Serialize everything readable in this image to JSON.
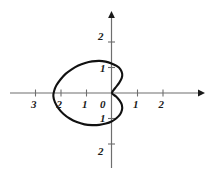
{
  "chart_data": {
    "type": "line",
    "title": "",
    "subtitle": "",
    "xlabel": "",
    "ylabel": "",
    "grid": false,
    "legend": false,
    "legend_position": "none",
    "coordinate_system": "cartesian-with-polar-curve",
    "xlim": [
      -3.6,
      3.5
    ],
    "ylim": [
      -2.6,
      2.6
    ],
    "x_ticks": [
      -3,
      -2,
      -1,
      0,
      1,
      2
    ],
    "x_tick_labels": [
      "3",
      "2",
      "1",
      "0",
      "1",
      "2"
    ],
    "y_ticks": [
      2,
      1,
      -1,
      -2
    ],
    "y_tick_labels": [
      "2",
      "1",
      "1",
      "2"
    ],
    "origin_label": "0",
    "axis_arrows": [
      "x-positive",
      "y-positive"
    ],
    "curve": {
      "name": "cardioid",
      "equation": "r = 1 - cos(theta)  (scaled, opening left)",
      "stroke": "#111111",
      "stroke_width": 2.1,
      "closed": true,
      "extent_left": -2.3,
      "extent_right": 0.42,
      "extent_top": 1.25,
      "extent_bottom": -1.25,
      "points": [
        [
          0.0,
          0.0
        ],
        [
          0.13,
          0.2
        ],
        [
          0.28,
          0.4
        ],
        [
          0.38,
          0.58
        ],
        [
          0.4,
          0.75
        ],
        [
          0.33,
          0.93
        ],
        [
          0.18,
          1.06
        ],
        [
          -0.02,
          1.16
        ],
        [
          -0.25,
          1.23
        ],
        [
          -0.5,
          1.26
        ],
        [
          -0.78,
          1.24
        ],
        [
          -1.05,
          1.18
        ],
        [
          -1.32,
          1.08
        ],
        [
          -1.58,
          0.93
        ],
        [
          -1.82,
          0.75
        ],
        [
          -2.02,
          0.53
        ],
        [
          -2.18,
          0.3
        ],
        [
          -2.27,
          0.08
        ],
        [
          -2.3,
          -0.12
        ],
        [
          -2.24,
          -0.36
        ],
        [
          -2.1,
          -0.6
        ],
        [
          -1.9,
          -0.82
        ],
        [
          -1.66,
          -1.0
        ],
        [
          -1.38,
          -1.14
        ],
        [
          -1.08,
          -1.23
        ],
        [
          -0.78,
          -1.26
        ],
        [
          -0.5,
          -1.25
        ],
        [
          -0.24,
          -1.2
        ],
        [
          -0.02,
          -1.12
        ],
        [
          0.16,
          -1.0
        ],
        [
          0.31,
          -0.85
        ],
        [
          0.39,
          -0.67
        ],
        [
          0.39,
          -0.48
        ],
        [
          0.3,
          -0.3
        ],
        [
          0.16,
          -0.14
        ],
        [
          0.0,
          0.0
        ]
      ]
    }
  },
  "axes_geometry": {
    "origin_px": [
      112,
      93
    ],
    "unit_px": 25.5
  }
}
